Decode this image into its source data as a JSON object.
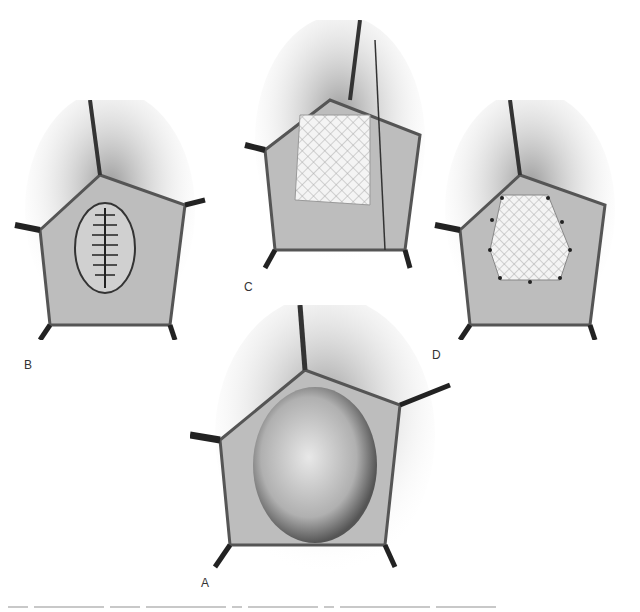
{
  "figure": {
    "panels": [
      {
        "id": "A",
        "label": "A",
        "description": "Exposed defect / mass within retracted incision"
      },
      {
        "id": "B",
        "label": "B",
        "description": "Defect closed with interrupted sutures"
      },
      {
        "id": "C",
        "label": "C",
        "description": "Mesh being placed and sutured over closure"
      },
      {
        "id": "D",
        "label": "D",
        "description": "Mesh fixed in place with interrupted sutures around edge"
      }
    ],
    "caption_visible": false
  }
}
